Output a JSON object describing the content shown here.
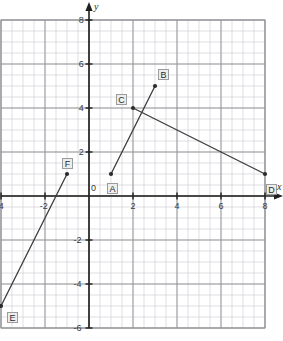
{
  "chart_data": {
    "type": "scatter",
    "title": "",
    "xlabel": "x",
    "ylabel": "y",
    "xlim": [
      -4,
      8
    ],
    "ylim": [
      -6,
      8
    ],
    "grid": true,
    "minor_grid_step": 0.5,
    "major_grid_step": 2,
    "legend": "none",
    "xticks": [
      "-4",
      "-2",
      "0",
      "2",
      "4",
      "6",
      "8"
    ],
    "xtick_values": [
      -4,
      -2,
      0,
      2,
      4,
      6,
      8
    ],
    "yticks": [
      "8",
      "6",
      "4",
      "2",
      "0",
      "-2",
      "-4",
      "-6"
    ],
    "ytick_values": [
      8,
      6,
      4,
      2,
      0,
      -2,
      -4,
      -6
    ],
    "points": [
      {
        "label": "A",
        "x": 1,
        "y": 1
      },
      {
        "label": "B",
        "x": 3,
        "y": 5
      },
      {
        "label": "C",
        "x": 2,
        "y": 4
      },
      {
        "label": "D",
        "x": 8,
        "y": 1
      },
      {
        "label": "E",
        "x": -4,
        "y": -5
      },
      {
        "label": "F",
        "x": -1,
        "y": 1
      }
    ],
    "segments": [
      {
        "name": "AB",
        "from": "A",
        "to": "B",
        "x": [
          1,
          3
        ],
        "y": [
          1,
          5
        ]
      },
      {
        "name": "CD",
        "from": "C",
        "to": "D",
        "x": [
          2,
          8
        ],
        "y": [
          4,
          1
        ]
      },
      {
        "name": "EF",
        "from": "E",
        "to": "F",
        "x": [
          -4,
          -1
        ],
        "y": [
          -5,
          1
        ]
      }
    ],
    "colors": {
      "segment": "#3c3c3c",
      "point": "#2b2b2b",
      "axis": "#1f1f1f",
      "major_grid": "#8e9094",
      "minor_grid": "#c9cbd0",
      "label_box_fill": "#eceded",
      "label_box_border": "#9b9c9e"
    }
  }
}
